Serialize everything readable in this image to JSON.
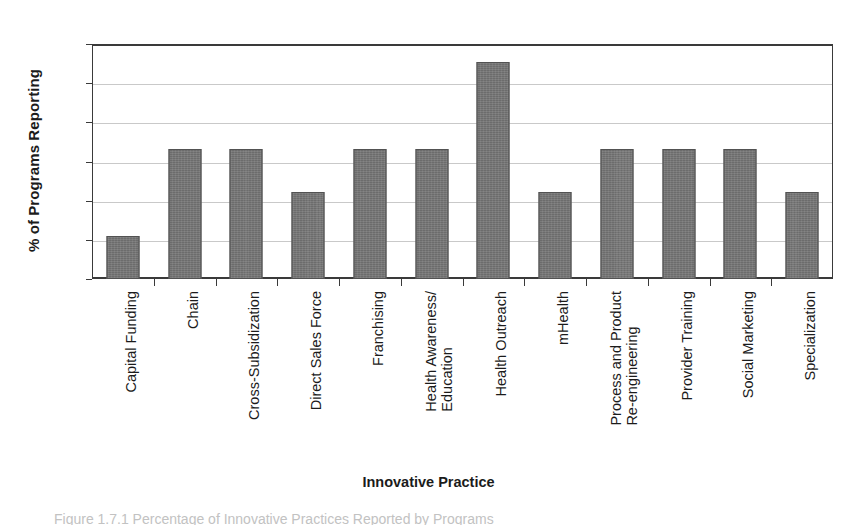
{
  "chart_data": {
    "type": "bar",
    "title": "",
    "xlabel": "Innovative Practice",
    "ylabel": "% of Programs Reporting",
    "ylim": [
      0,
      60
    ],
    "yticks": [
      0,
      10,
      20,
      30,
      40,
      50,
      60
    ],
    "grid": true,
    "legend": false,
    "categories": [
      "Capital Funding",
      "Chain",
      "Cross-Subsidization",
      "Direct Sales Force",
      "Franchising",
      "Health Awareness/ Education",
      "Health Outreach",
      "mHealth",
      "Process and Product Re-engineering",
      "Provider Training",
      "Social Marketing",
      "Specialization"
    ],
    "category_lines": [
      [
        "Capital Funding"
      ],
      [
        "Chain"
      ],
      [
        "Cross-Subsidization"
      ],
      [
        "Direct Sales Force"
      ],
      [
        "Franchising"
      ],
      [
        "Health Awareness/",
        "Education"
      ],
      [
        "Health Outreach"
      ],
      [
        "mHealth"
      ],
      [
        "Process and Product",
        "Re-engineering"
      ],
      [
        "Provider Training"
      ],
      [
        "Social Marketing"
      ],
      [
        "Specialization"
      ]
    ],
    "values": [
      11.1,
      33.3,
      33.3,
      22.2,
      33.3,
      33.3,
      55.4,
      22.2,
      33.3,
      33.3,
      33.3,
      22.2
    ],
    "bar_color": "#6c6c6c",
    "grid_color": "#c9c9c9",
    "axis_color": "#3a3a3a"
  },
  "caption": {
    "text": "Figure 1.7.1  Percentage of Innovative Practices Reported by Programs"
  }
}
